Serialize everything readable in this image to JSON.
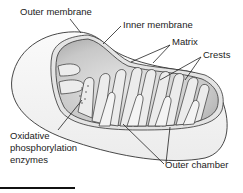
{
  "diagram": {
    "labels": {
      "outer_membrane": "Outer membrane",
      "inner_membrane": "Inner membrane",
      "matrix": "Matrix",
      "crests": "Crests",
      "oxidative_line1": "Oxidative",
      "oxidative_line2": "phosphorylation",
      "oxidative_line3": "enzymes",
      "outer_chamber": "Outer chamber"
    },
    "colors": {
      "outline": "#333333",
      "outer_fill": "#f2f2f2",
      "inner_fill": "#cfcfcf",
      "membrane_band": "#e8e8e8",
      "text": "#222222"
    }
  }
}
